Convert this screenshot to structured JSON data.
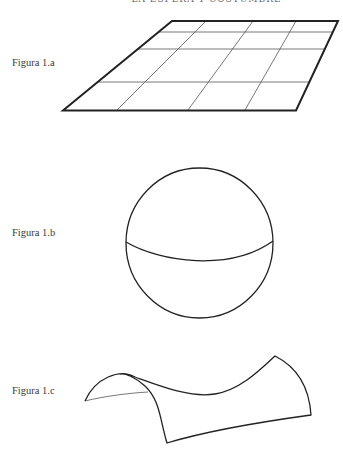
{
  "running_head": "LA ESFERA Y COSTUMBRE",
  "figures": [
    {
      "label": "Figura 1.a",
      "description": "flat plane with grid"
    },
    {
      "label": "Figura 1.b",
      "description": "sphere with equator"
    },
    {
      "label": "Figura 1.c",
      "description": "saddle (hyperbolic) surface"
    }
  ],
  "colors": {
    "stroke": "#222222",
    "grid": "#555555",
    "text": "#3a3a3a"
  }
}
